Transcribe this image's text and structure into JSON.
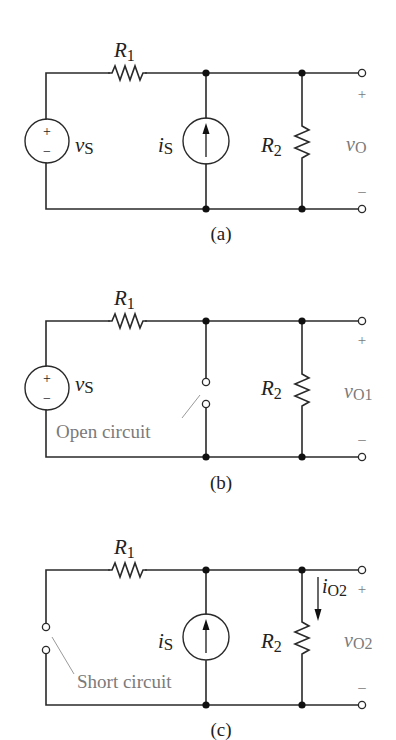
{
  "figure": {
    "panels": [
      {
        "id": "a",
        "caption": "(a)",
        "r1_label": "R",
        "r1_sub": "1",
        "vs_label": "v",
        "vs_sub": "S",
        "vs_plus": "+",
        "vs_minus": "−",
        "is_label": "i",
        "is_sub": "S",
        "r2_label": "R",
        "r2_sub": "2",
        "out_label": "v",
        "out_sub": "O",
        "out_plus": "+",
        "out_minus": "–"
      },
      {
        "id": "b",
        "caption": "(b)",
        "r1_label": "R",
        "r1_sub": "1",
        "vs_label": "v",
        "vs_sub": "S",
        "vs_plus": "+",
        "vs_minus": "−",
        "open_circuit_note": "Open circuit",
        "r2_label": "R",
        "r2_sub": "2",
        "out_label": "v",
        "out_sub": "O1",
        "out_plus": "+",
        "out_minus": "–"
      },
      {
        "id": "c",
        "caption": "(c)",
        "r1_label": "R",
        "r1_sub": "1",
        "short_circuit_note": "Short circuit",
        "is_label": "i",
        "is_sub": "S",
        "r2_label": "R",
        "r2_sub": "2",
        "io_label": "i",
        "io_sub": "O2",
        "out_label": "v",
        "out_sub": "O2",
        "out_plus": "+",
        "out_minus": "–"
      }
    ]
  }
}
